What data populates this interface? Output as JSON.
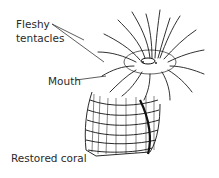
{
  "figure": {
    "labels": {
      "fleshy": "Fleshy",
      "tentacles": "tentacles",
      "mouth": "Mouth",
      "restored_coral": "Restored coral"
    },
    "colors": {
      "ink": "#1a1a1a",
      "background": "#ffffff",
      "label": "#2a2a2a"
    }
  }
}
